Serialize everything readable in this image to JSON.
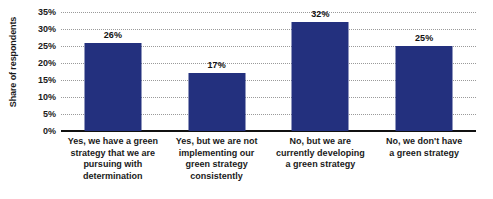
{
  "chart_data": {
    "type": "bar",
    "title": "",
    "xlabel": "",
    "ylabel": "Share of respondents",
    "ylim": [
      0,
      35
    ],
    "grid": true,
    "legend": false,
    "bar_color": "#23307e",
    "categories": [
      "Yes, we have a green strategy that we are pursuing with determination",
      "Yes, but we are not implementing our green strategy consistently",
      "No, but we are currently developing a green strategy",
      "No, we don't have a green strategy"
    ],
    "values": [
      26,
      17,
      32,
      25
    ],
    "value_labels": [
      "26%",
      "17%",
      "32%",
      "25%"
    ],
    "ytick_values": [
      0,
      5,
      10,
      15,
      20,
      25,
      30,
      35
    ],
    "ytick_labels": [
      "0%",
      "5%",
      "10%",
      "15%",
      "20%",
      "25%",
      "30%",
      "35%"
    ],
    "category_lines": [
      [
        "Yes, we have a green",
        "strategy that we are",
        "pursuing with",
        "determination"
      ],
      [
        "Yes, but we are not",
        "implementing our",
        "green strategy",
        "consistently"
      ],
      [
        "No, but we are",
        "currently developing",
        "a green strategy"
      ],
      [
        "No, we don't have",
        "a green strategy"
      ]
    ]
  }
}
